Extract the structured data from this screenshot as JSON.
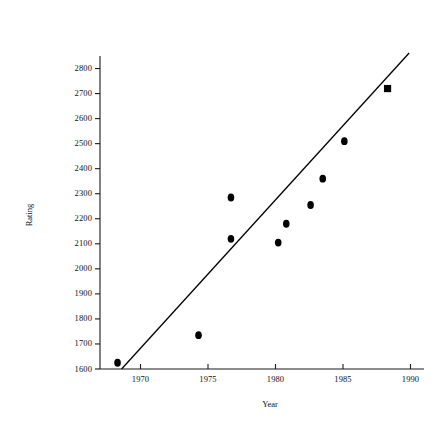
{
  "chart_data": {
    "type": "scatter",
    "title": "",
    "xlabel": "Year",
    "ylabel": "Rating",
    "xlim": [
      1967,
      1991
    ],
    "ylim": [
      1600,
      2850
    ],
    "xticks": [
      1970,
      1975,
      1980,
      1985,
      1990
    ],
    "xticklabels": [
      "1970",
      "1975",
      "1980",
      "1985",
      "1990"
    ],
    "yticks": [
      1600,
      1700,
      1800,
      1900,
      2000,
      2100,
      2200,
      2300,
      2400,
      2500,
      2600,
      2700,
      2800
    ],
    "yticklabels": [
      "1600",
      "1700",
      "1800",
      "1900",
      "2000",
      "2100",
      "2200",
      "2300",
      "2400",
      "2500",
      "2600",
      "2700",
      "2800"
    ],
    "grid": false,
    "legend": null,
    "series": [
      {
        "name": "observations",
        "marker": "circle",
        "color": "#000000",
        "points": [
          {
            "x": 1968.3,
            "y": 1625
          },
          {
            "x": 1974.3,
            "y": 1735
          },
          {
            "x": 1976.7,
            "y": 2285
          },
          {
            "x": 1976.7,
            "y": 2120
          },
          {
            "x": 1980.2,
            "y": 2105
          },
          {
            "x": 1980.8,
            "y": 2180
          },
          {
            "x": 1982.6,
            "y": 2255
          },
          {
            "x": 1983.5,
            "y": 2360
          },
          {
            "x": 1985.1,
            "y": 2510
          }
        ]
      },
      {
        "name": "highlighted-observation",
        "marker": "square",
        "color": "#000000",
        "points": [
          {
            "x": 1988.3,
            "y": 2720
          }
        ]
      }
    ],
    "trendline": {
      "name": "fit-line",
      "color": "#000000",
      "x0": 1968.6,
      "y0": 1600,
      "x1": 1989.9,
      "y1": 2862
    }
  },
  "axes": {
    "x_axis_name": "year-axis",
    "y_axis_name": "rating-axis"
  }
}
